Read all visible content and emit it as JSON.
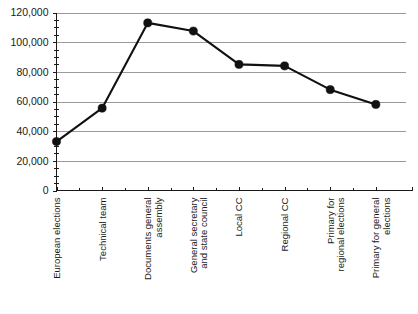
{
  "chart_data": {
    "type": "line",
    "title": "",
    "subtitle": "",
    "xlabel": "",
    "ylabel": "",
    "categories": [
      "European elections",
      "Technical team",
      "Documents general assembly",
      "General secretary and state council",
      "Local CC",
      "Regional CC",
      "Primary for regional elections",
      "Primary for general elections"
    ],
    "values": [
      33000,
      55500,
      113000,
      107500,
      85000,
      84000,
      68000,
      58000
    ],
    "series": [
      {
        "name": "series-1",
        "values": [
          33000,
          55500,
          113000,
          107500,
          85000,
          84000,
          68000,
          58000
        ]
      }
    ],
    "ylim": [
      0,
      120000
    ],
    "ytick_values": [
      0,
      20000,
      40000,
      60000,
      80000,
      100000,
      120000
    ],
    "ytick_labels": [
      "0",
      "20,000",
      "40,000",
      "60,000",
      "80,000",
      "100,000",
      "120,000"
    ],
    "grid": true,
    "legend": false,
    "legend_position": "none",
    "marker": "circle",
    "line_color": "#111111",
    "marker_color": "#111111",
    "grid_color": "#9a9a9a",
    "axis_color": "#1a1a1a",
    "background_color": "#ffffff"
  }
}
